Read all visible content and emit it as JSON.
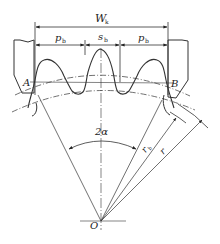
{
  "figure": {
    "labels": {
      "span_length": {
        "main": "W",
        "sub": "k"
      },
      "base_pitch_left": {
        "main": "p",
        "sub": "b"
      },
      "base_tooth_thickness": {
        "main": "s",
        "sub": "b"
      },
      "base_pitch_right": {
        "main": "p",
        "sub": "b"
      },
      "point_a": "A",
      "point_b": "B",
      "angle": "2α",
      "base_radius": {
        "main": "r",
        "sub": "b"
      },
      "pitch_radius": "r",
      "center": "O"
    },
    "colors": {
      "line": "#333333",
      "background": "#ffffff"
    }
  }
}
